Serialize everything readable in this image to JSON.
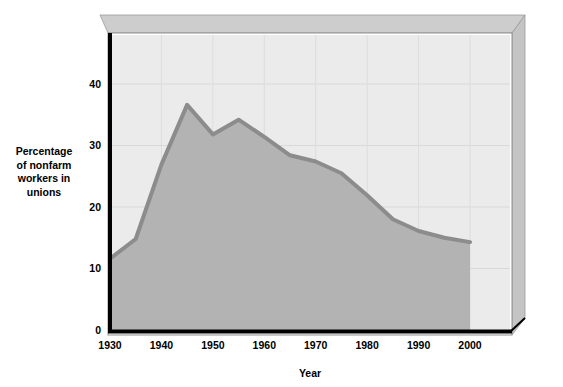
{
  "chart_data": {
    "type": "area",
    "title": "",
    "xlabel": "Year",
    "ylabel": "Percentage of nonfarm workers in unions",
    "ylabel_lines": [
      "Percentage",
      "of nonfarm",
      "workers in",
      "unions"
    ],
    "x": [
      1930,
      1935,
      1940,
      1945,
      1950,
      1955,
      1960,
      1965,
      1970,
      1975,
      1980,
      1985,
      1990,
      1995,
      2000
    ],
    "values": [
      11.6,
      14.8,
      26.9,
      36.6,
      31.8,
      34.2,
      31.4,
      28.4,
      27.4,
      25.5,
      21.9,
      18.0,
      16.1,
      15.0,
      14.3
    ],
    "series": [
      {
        "name": "Percentage of nonfarm workers in unions",
        "values": [
          11.6,
          14.8,
          26.9,
          36.6,
          31.8,
          34.2,
          31.4,
          28.4,
          27.4,
          25.5,
          21.9,
          18.0,
          16.1,
          15.0,
          14.3
        ]
      }
    ],
    "xlim": [
      1930,
      2000
    ],
    "ylim": [
      0,
      48
    ],
    "xticks": [
      1930,
      1940,
      1950,
      1960,
      1970,
      1980,
      1990,
      2000
    ],
    "xtick_labels": [
      "1930",
      "1940",
      "1950",
      "1960",
      "1970",
      "1980",
      "1990",
      "2000"
    ],
    "yticks": [
      0,
      10,
      20,
      30,
      40
    ],
    "ytick_labels": [
      "0",
      "10",
      "20",
      "30",
      "40"
    ],
    "grid": true,
    "legend": "none",
    "colors": {
      "area_fill": "#b3b3b3",
      "line": "#8c8c8c",
      "plot_background": "#ebebeb",
      "grid": "#d6d6d6",
      "axis": "#000000",
      "frame_top": "#cdcdcd",
      "frame_side": "#c4c4c4",
      "text": "#000000"
    }
  },
  "axes": {
    "x_axis_title": "Year",
    "y_axis_title_lines": [
      "Percentage",
      "of nonfarm",
      "workers in",
      "unions"
    ]
  },
  "ticks": {
    "x": [
      "1930",
      "1940",
      "1950",
      "1960",
      "1970",
      "1980",
      "1990",
      "2000"
    ],
    "y": [
      "0",
      "10",
      "20",
      "30",
      "40"
    ]
  }
}
